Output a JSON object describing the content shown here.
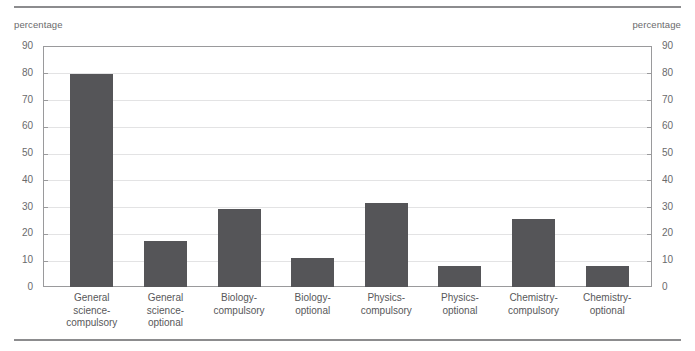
{
  "figure": {
    "left_axis_caption": "percentage",
    "right_axis_caption": "percentage"
  },
  "chart_data": {
    "type": "bar",
    "title": "",
    "xlabel": "",
    "ylabel": "percentage",
    "y2label": "percentage",
    "ylim": [
      0,
      90
    ],
    "yticks": [
      0,
      10,
      20,
      30,
      40,
      50,
      60,
      70,
      80,
      90
    ],
    "y2ticks": [
      0,
      10,
      20,
      30,
      40,
      50,
      60,
      70,
      80,
      90
    ],
    "grid": true,
    "legend": false,
    "bar_color": "#555558",
    "categories": [
      "General\nscience-\ncompulsory",
      "General\nscience-\noptional",
      "Biology-\ncompulsory",
      "Biology-\noptional",
      "Physics-\ncompulsory",
      "Physics-\noptional",
      "Chemistry-\ncompulsory",
      "Chemistry-\noptional"
    ],
    "values": [
      79.5,
      17.0,
      29.3,
      10.8,
      31.3,
      7.8,
      25.5,
      7.8
    ]
  }
}
